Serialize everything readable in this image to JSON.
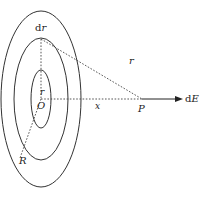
{
  "diagram": {
    "type": "ring-charge-field",
    "labels": {
      "dr": {
        "prefix": "d",
        "var": "r"
      },
      "r_outer_line": "r",
      "r_inner": "r",
      "origin": "O",
      "x": "x",
      "point": "P",
      "field": {
        "prefix": "d",
        "var": "E"
      },
      "radius": "R"
    },
    "rings": [
      {
        "name": "outer-disk-edge",
        "cx": 41,
        "cy": 99,
        "rx": 40,
        "ry": 88
      },
      {
        "name": "ring-outer",
        "cx": 41,
        "cy": 99,
        "rx": 27,
        "ry": 61
      },
      {
        "name": "ring-inner",
        "cx": 41,
        "cy": 99,
        "rx": 10,
        "ry": 29
      }
    ],
    "colors": {
      "stroke": "#333333",
      "background": "#ffffff"
    }
  }
}
